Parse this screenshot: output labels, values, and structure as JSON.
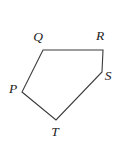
{
  "figure": {
    "name": "pentagon-PQRST",
    "shape_type": "pentagon",
    "background_color": "#ffffff",
    "stroke_color": "#3a3a3a",
    "stroke_width": 1.1,
    "canvas": {
      "width": 118,
      "height": 145
    },
    "vertices": [
      {
        "id": "P",
        "label": "P",
        "x": 22,
        "y": 92,
        "label_x": 13,
        "label_y": 89
      },
      {
        "id": "Q",
        "label": "Q",
        "x": 43,
        "y": 50,
        "label_x": 38,
        "label_y": 37
      },
      {
        "id": "R",
        "label": "R",
        "x": 103,
        "y": 50,
        "label_x": 100,
        "label_y": 36
      },
      {
        "id": "S",
        "label": "S",
        "x": 102,
        "y": 72,
        "label_x": 108,
        "label_y": 76
      },
      {
        "id": "T",
        "label": "T",
        "x": 56,
        "y": 120,
        "label_x": 55,
        "label_y": 132
      }
    ],
    "edges": [
      {
        "id": "QR",
        "from": "Q",
        "to": "R"
      },
      {
        "id": "RS",
        "from": "R",
        "to": "S"
      },
      {
        "id": "ST",
        "from": "S",
        "to": "T"
      },
      {
        "id": "TP",
        "from": "T",
        "to": "P"
      },
      {
        "id": "PQ",
        "from": "P",
        "to": "Q"
      }
    ],
    "polygon_points": "43,50 103,50 102,72 56,120 22,92"
  }
}
